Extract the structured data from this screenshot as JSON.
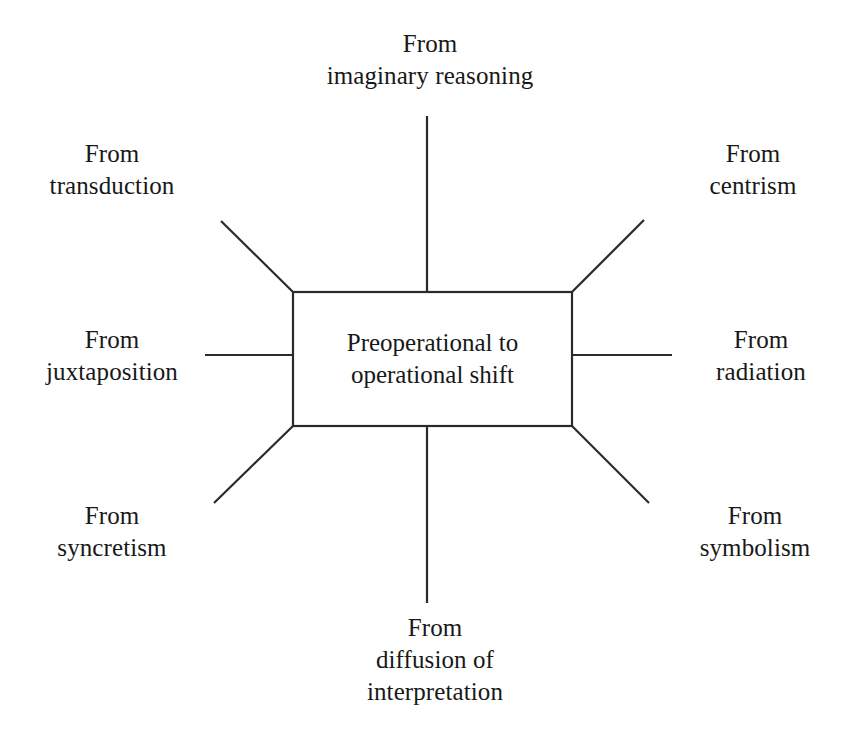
{
  "diagram": {
    "type": "radial-spoke",
    "center": {
      "text": "Preoperational to\noperational shift"
    },
    "stroke_color": "#2a2a2a",
    "background_color": "#ffffff",
    "nodes": [
      {
        "id": "top",
        "text": "From\nimaginary reasoning"
      },
      {
        "id": "top-left",
        "text": "From\ntransduction"
      },
      {
        "id": "top-right",
        "text": "From\ncentrism"
      },
      {
        "id": "left",
        "text": "From\njuxtaposition"
      },
      {
        "id": "right",
        "text": "From\nradiation"
      },
      {
        "id": "bottom-left",
        "text": "From\nsyncretism"
      },
      {
        "id": "bottom-right",
        "text": "From\nsymbolism"
      },
      {
        "id": "bottom",
        "text": "From\ndiffusion of\ninterpretation"
      }
    ]
  }
}
